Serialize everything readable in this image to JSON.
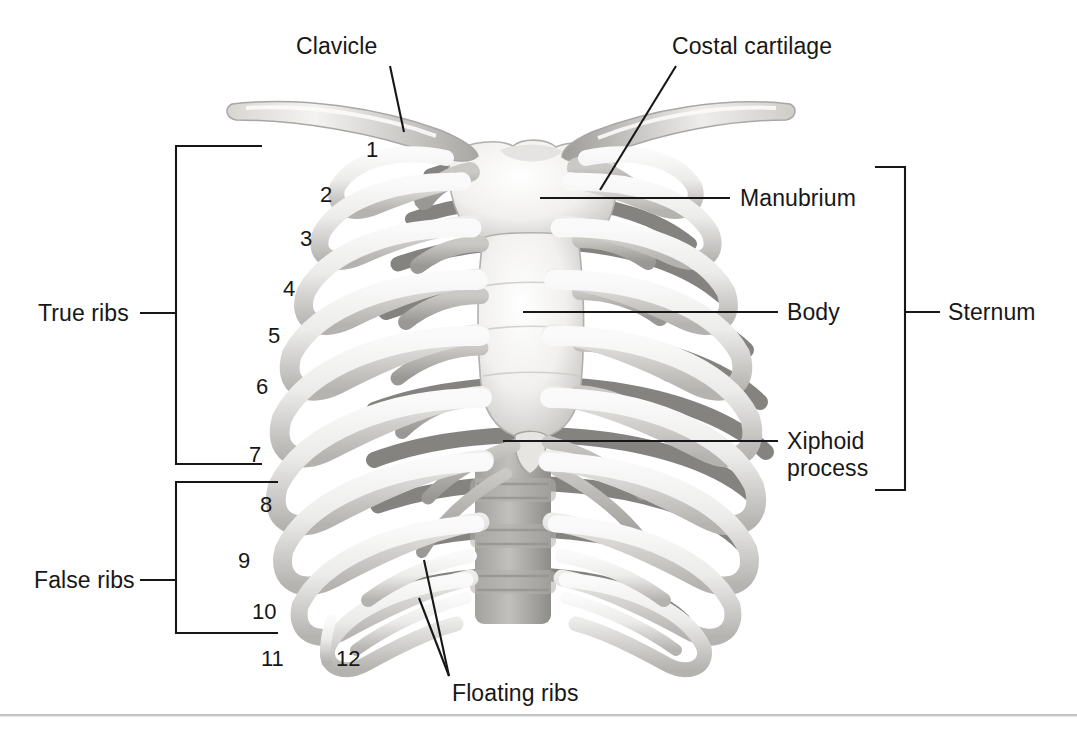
{
  "figure": {
    "background_color": "#ffffff",
    "line_color": "#171717",
    "text_color": "#171717",
    "bone_light": "#f2f1ef",
    "bone_mid": "#c9c7c4",
    "bone_dark": "#8f8d8a",
    "bone_shadow": "#6f6d6b",
    "cartilage": "#b9b7b4",
    "footer_rule_color": "#bdbdbd"
  },
  "labels": {
    "clavicle": "Clavicle",
    "costal_cartilage": "Costal cartilage",
    "manubrium": "Manubrium",
    "body": "Body",
    "xiphoid_line1": "Xiphoid",
    "xiphoid_line2": "process",
    "sternum": "Sternum",
    "true_ribs": "True ribs",
    "false_ribs": "False ribs",
    "floating_ribs": "Floating ribs"
  },
  "rib_numbers": [
    {
      "n": "1",
      "x": 366,
      "y": 139
    },
    {
      "n": "2",
      "x": 320,
      "y": 184
    },
    {
      "n": "3",
      "x": 300,
      "y": 228
    },
    {
      "n": "4",
      "x": 283,
      "y": 278
    },
    {
      "n": "5",
      "x": 268,
      "y": 325
    },
    {
      "n": "6",
      "x": 256,
      "y": 376
    },
    {
      "n": "7",
      "x": 249,
      "y": 444
    },
    {
      "n": "8",
      "x": 260,
      "y": 494
    },
    {
      "n": "9",
      "x": 238,
      "y": 550
    },
    {
      "n": "10",
      "x": 252,
      "y": 601
    },
    {
      "n": "11",
      "x": 261,
      "y": 648
    },
    {
      "n": "12",
      "x": 336,
      "y": 648
    }
  ],
  "brackets": {
    "true_ribs": {
      "label": "True ribs",
      "top": 146,
      "bottom": 464,
      "stem_x": 176,
      "arm_x": 262,
      "tick_x": 140,
      "mid": 313
    },
    "false_ribs": {
      "label": "False ribs",
      "top": 482,
      "bottom": 633,
      "stem_x": 176,
      "arm_x": 278,
      "tick_x": 140,
      "mid": 580
    },
    "sternum": {
      "label": "Sternum",
      "top": 167,
      "bottom": 490,
      "stem_x": 905,
      "arm_x": 875,
      "tick_x": 938,
      "mid": 312
    }
  },
  "leaders": {
    "clavicle": {
      "text_x": 296,
      "text_y": 50,
      "from_x": 390,
      "from_y": 66,
      "to_x": 402,
      "to_y": 131
    },
    "costal_cartilage": {
      "text_x": 672,
      "text_y": 50,
      "from_x": 676,
      "from_y": 66,
      "to_x": 602,
      "to_y": 188
    },
    "manubrium": {
      "text_x": 738,
      "text_y": 186,
      "line_from_x": 540,
      "line_to_x": 728,
      "line_y": 198
    },
    "body": {
      "text_x": 785,
      "text_y": 298,
      "line_from_x": 523,
      "line_to_x": 775,
      "line_y": 312
    },
    "xiphoid": {
      "text_x": 785,
      "text_y": 428,
      "line_from_x": 503,
      "line_to_x": 775,
      "line_y": 441
    },
    "floating_ribs": {
      "text_x": 452,
      "text_y": 688,
      "tip_x": 449,
      "tip_y": 678,
      "a_x": 424,
      "a_y": 560,
      "b_x": 419,
      "b_y": 597
    }
  },
  "anatomy_parts": [
    "clavicle-left",
    "clavicle-right",
    "manubrium",
    "sternum-body",
    "xiphoid-process",
    "costal-cartilage",
    "ribs-1-to-12",
    "thoracic-vertebrae",
    "floating-rib-11",
    "floating-rib-12"
  ]
}
